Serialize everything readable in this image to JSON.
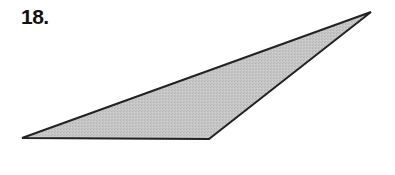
{
  "problem": {
    "number_label": "18."
  },
  "figure": {
    "shape": "obtuse-triangle",
    "fill_color": "#c4c4c4",
    "stroke_color": "#222222",
    "stroke_width": 2,
    "vertices": {
      "left": [
        22,
        138
      ],
      "bottom_right": [
        209,
        139
      ],
      "top_right": [
        371,
        12
      ]
    }
  }
}
